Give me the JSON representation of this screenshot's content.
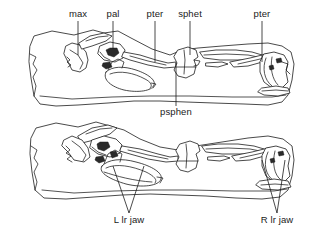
{
  "figure": {
    "kind": "scientific-line-drawing",
    "background_color": "#ffffff",
    "line_color": "#1c1c1c"
  },
  "labels": {
    "upper": [
      {
        "id": "max",
        "text": "max",
        "x": 78,
        "y": 17,
        "leader": {
          "x1": 78,
          "y1": 21,
          "x2": 78,
          "y2": 55
        }
      },
      {
        "id": "pal",
        "text": "pal",
        "x": 113,
        "y": 17,
        "leader": {
          "x1": 113,
          "y1": 21,
          "x2": 113,
          "y2": 49
        }
      },
      {
        "id": "pter1",
        "text": "pter",
        "x": 155,
        "y": 17,
        "leader": {
          "x1": 155,
          "y1": 21,
          "x2": 155,
          "y2": 62
        }
      },
      {
        "id": "sphet",
        "text": "sphet",
        "x": 190,
        "y": 17,
        "leader": {
          "x1": 190,
          "y1": 21,
          "x2": 190,
          "y2": 55
        }
      },
      {
        "id": "pter2",
        "text": "pter",
        "x": 262,
        "y": 17,
        "leader": {
          "x1": 262,
          "y1": 21,
          "x2": 262,
          "y2": 62
        }
      }
    ],
    "upper_below": [
      {
        "id": "psphen",
        "text": "psphen",
        "x": 176,
        "y": 113,
        "leader": {
          "x1": 176,
          "y1": 63,
          "x2": 176,
          "y2": 106
        }
      }
    ],
    "lower": [
      {
        "id": "l-lr-jaw",
        "text": "L lr jaw",
        "x": 129,
        "y": 222,
        "leaders": [
          {
            "x1": 129,
            "y1": 213,
            "x2": 113,
            "y2": 166
          },
          {
            "x1": 129,
            "y1": 213,
            "x2": 144,
            "y2": 166
          }
        ]
      },
      {
        "id": "r-lr-jaw",
        "text": "R lr jaw",
        "x": 277,
        "y": 222,
        "leaders": [
          {
            "x1": 277,
            "y1": 213,
            "x2": 262,
            "y2": 160
          },
          {
            "x1": 277,
            "y1": 213,
            "x2": 285,
            "y2": 160
          }
        ]
      }
    ]
  },
  "panels": [
    {
      "id": "upper-block",
      "name": "upper specimen block",
      "bbox": [
        28,
        28,
        294,
        108
      ]
    },
    {
      "id": "lower-block",
      "name": "lower specimen block",
      "bbox": [
        28,
        122,
        294,
        200
      ]
    }
  ],
  "anatomy_terms": {
    "max": "maxilla",
    "pal": "palatine",
    "pter": "pterygoid",
    "sphet": "sphenethmoid",
    "psphen": "parasphenoid",
    "lr jaw": "lower jaw"
  }
}
